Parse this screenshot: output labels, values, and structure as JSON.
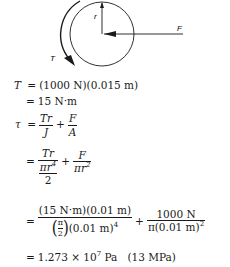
{
  "diagram": {
    "labels": {
      "radius": "r",
      "force": "F",
      "torque": "T"
    }
  },
  "equations": {
    "row1": {
      "lhs": "T",
      "eq": "=",
      "rhs": "(1000 N)(0.015 m)"
    },
    "row2": {
      "eq": "=",
      "rhs": "15 N·m"
    },
    "row3": {
      "lhs": "τ",
      "eq": "=",
      "f1_num": "Tr",
      "f1_den": "J",
      "plus": "+",
      "f2_num": "F",
      "f2_den": "A"
    },
    "row4": {
      "eq": "=",
      "f1_num": "Tr",
      "f1_den_top": "πr",
      "f1_den_top_exp": "4",
      "f1_den_bottom": "2",
      "plus": "+",
      "f2_num": "F",
      "f2_den": "πr",
      "f2_den_exp": "2"
    },
    "row5": {
      "eq": "=",
      "f1_num": "(15 N·m)(0.01 m)",
      "paren_open": "(",
      "pi": "π",
      "two": "2",
      "paren_close": ")",
      "f1_den_rest": "(0.01 m)",
      "f1_den_exp": "4",
      "plus": "+",
      "f2_num": "1000 N",
      "f2_den": "π(0.01 m)",
      "f2_den_exp": "2"
    },
    "row6": {
      "eq": "=",
      "value": "1.273 × 10",
      "exp": "7",
      "unit": " Pa",
      "alt": "(13 MPa)"
    }
  }
}
